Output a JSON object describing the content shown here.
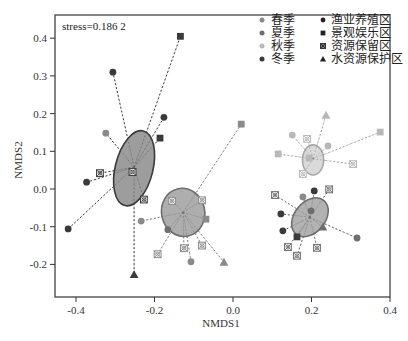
{
  "chart_data": {
    "type": "scatter",
    "title": "",
    "annotation": "stress=0.186 2",
    "xlabel": "NMDS1",
    "ylabel": "NMDS2",
    "xlim": [
      -0.46,
      0.4
    ],
    "ylim": [
      -0.29,
      0.46
    ],
    "x_ticks": [
      -0.4,
      -0.2,
      0.0,
      0.2,
      0.4
    ],
    "x_tick_labels": [
      "-0.4",
      "-0.2",
      "0.0",
      "0.2",
      "0.4"
    ],
    "y_ticks": [
      -0.2,
      -0.1,
      0.0,
      0.1,
      0.2,
      0.3,
      0.4
    ],
    "y_tick_labels": [
      "-0.2",
      "-0.1",
      "0.0",
      "0.1",
      "0.2",
      "0.3",
      "0.4"
    ],
    "grid": false,
    "legend_position": "top-right",
    "legend": {
      "seasons": [
        {
          "label": "春季",
          "color": "#8a8a8a"
        },
        {
          "label": "夏季",
          "color": "#6e6e6e"
        },
        {
          "label": "秋季",
          "color": "#b8b8b8"
        },
        {
          "label": "冬季",
          "color": "#3a3a3a"
        }
      ],
      "zones": [
        {
          "label": "渔业养殖区",
          "shape": "circle"
        },
        {
          "label": "景观娱乐区",
          "shape": "square"
        },
        {
          "label": "资源保留区",
          "shape": "crossed-square"
        },
        {
          "label": "水资源保护区",
          "shape": "triangle"
        }
      ]
    },
    "series": [
      {
        "name": "冬季",
        "color": "#3a3a3a",
        "ellipse": {
          "cx": -0.252,
          "cy": 0.055,
          "rx": 0.048,
          "ry": 0.102,
          "angle": 14,
          "fill": "#8c8c8c",
          "stroke": "#3a3a3a"
        },
        "centroid": [
          -0.252,
          0.058
        ],
        "points": [
          {
            "x": -0.134,
            "y": 0.405,
            "shape": "square"
          },
          {
            "x": -0.306,
            "y": 0.31,
            "shape": "circle"
          },
          {
            "x": -0.176,
            "y": 0.19,
            "shape": "circle"
          },
          {
            "x": -0.186,
            "y": 0.135,
            "shape": "square"
          },
          {
            "x": -0.324,
            "y": 0.148,
            "shape": "circle",
            "color": "#8a8a8a"
          },
          {
            "x": -0.339,
            "y": 0.042,
            "shape": "crossed-square"
          },
          {
            "x": -0.373,
            "y": 0.018,
            "shape": "circle"
          },
          {
            "x": -0.42,
            "y": -0.106,
            "shape": "circle"
          },
          {
            "x": -0.256,
            "y": 0.045,
            "shape": "crossed-square"
          },
          {
            "x": -0.227,
            "y": -0.028,
            "shape": "crossed-square"
          },
          {
            "x": -0.252,
            "y": -0.227,
            "shape": "triangle"
          }
        ]
      },
      {
        "name": "春季",
        "color": "#8a8a8a",
        "ellipse": {
          "cx": -0.127,
          "cy": -0.062,
          "rx": 0.055,
          "ry": 0.064,
          "angle": -12,
          "fill": "#a0a0a0",
          "stroke": "#6e6e6e"
        },
        "centroid": [
          -0.127,
          -0.062
        ],
        "points": [
          {
            "x": 0.021,
            "y": 0.172,
            "shape": "square"
          },
          {
            "x": -0.155,
            "y": -0.032,
            "shape": "crossed-square"
          },
          {
            "x": -0.079,
            "y": -0.03,
            "shape": "crossed-square"
          },
          {
            "x": -0.234,
            "y": -0.085,
            "shape": "circle"
          },
          {
            "x": -0.069,
            "y": -0.08,
            "shape": "square"
          },
          {
            "x": -0.166,
            "y": -0.108,
            "shape": "circle",
            "color": "#6e6e6e"
          },
          {
            "x": -0.192,
            "y": -0.173,
            "shape": "crossed-square"
          },
          {
            "x": -0.125,
            "y": -0.157,
            "shape": "crossed-square"
          },
          {
            "x": -0.079,
            "y": -0.15,
            "shape": "crossed-square"
          },
          {
            "x": -0.107,
            "y": -0.193,
            "shape": "circle"
          },
          {
            "x": -0.023,
            "y": -0.194,
            "shape": "triangle"
          }
        ]
      },
      {
        "name": "秋季",
        "color": "#b8b8b8",
        "ellipse": {
          "cx": 0.204,
          "cy": 0.077,
          "rx": 0.027,
          "ry": 0.04,
          "angle": 0,
          "fill": "#d4d4d4",
          "stroke": "#a8a8a8"
        },
        "centroid": [
          0.204,
          0.08
        ],
        "points": [
          {
            "x": 0.237,
            "y": 0.196,
            "shape": "triangle"
          },
          {
            "x": 0.151,
            "y": 0.143,
            "shape": "circle"
          },
          {
            "x": 0.189,
            "y": 0.133,
            "shape": "crossed-square"
          },
          {
            "x": 0.242,
            "y": 0.114,
            "shape": "circle"
          },
          {
            "x": 0.115,
            "y": 0.093,
            "shape": "square"
          },
          {
            "x": 0.194,
            "y": 0.082,
            "shape": "square"
          },
          {
            "x": 0.375,
            "y": 0.151,
            "shape": "square"
          },
          {
            "x": 0.306,
            "y": 0.066,
            "shape": "crossed-square"
          },
          {
            "x": 0.178,
            "y": 0.04,
            "shape": "crossed-square"
          }
        ]
      },
      {
        "name": "夏季",
        "color": "#6e6e6e",
        "ellipse": {
          "cx": 0.196,
          "cy": -0.075,
          "rx": 0.039,
          "ry": 0.058,
          "angle": 40,
          "fill": "#a4a4a4",
          "stroke": "#6e6e6e"
        },
        "centroid": [
          0.196,
          -0.075
        ],
        "points": [
          {
            "x": 0.107,
            "y": -0.016,
            "shape": "crossed-square"
          },
          {
            "x": 0.245,
            "y": -0.001,
            "shape": "crossed-square"
          },
          {
            "x": 0.207,
            "y": -0.005,
            "shape": "circle",
            "color": "#3a3a3a"
          },
          {
            "x": 0.178,
            "y": -0.021,
            "shape": "circle",
            "color": "#8a8a8a"
          },
          {
            "x": 0.122,
            "y": -0.066,
            "shape": "circle",
            "color": "#3a3a3a"
          },
          {
            "x": 0.127,
            "y": -0.111,
            "shape": "circle",
            "color": "#3a3a3a"
          },
          {
            "x": 0.199,
            "y": -0.058,
            "shape": "circle"
          },
          {
            "x": 0.229,
            "y": -0.101,
            "shape": "triangle"
          },
          {
            "x": 0.316,
            "y": -0.13,
            "shape": "circle"
          },
          {
            "x": 0.163,
            "y": -0.127,
            "shape": "square",
            "color": "#3a3a3a"
          },
          {
            "x": 0.14,
            "y": -0.154,
            "shape": "crossed-square"
          },
          {
            "x": 0.214,
            "y": -0.156,
            "shape": "crossed-square"
          },
          {
            "x": 0.163,
            "y": -0.177,
            "shape": "crossed-square"
          }
        ]
      }
    ]
  }
}
